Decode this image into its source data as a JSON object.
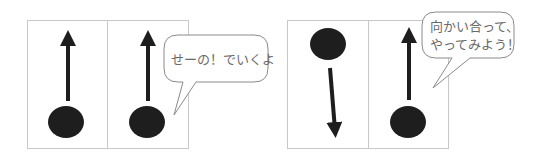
{
  "diagrams": [
    {
      "name": "same-direction",
      "panels": [
        {
          "arrow": "up",
          "ball": "bottom"
        },
        {
          "arrow": "up",
          "ball": "bottom"
        }
      ],
      "bubble": {
        "text": "せーの！でいくよ"
      }
    },
    {
      "name": "facing-each-other",
      "panels": [
        {
          "arrow": "down",
          "ball": "top"
        },
        {
          "arrow": "up",
          "ball": "bottom"
        }
      ],
      "bubble": {
        "line1": "向かい合って、",
        "line2": "やってみよう！"
      }
    }
  ],
  "colors": {
    "frame": "#c8c8c8",
    "ink": "#1e1e1e",
    "bubble_text": "#6a6a6a"
  }
}
